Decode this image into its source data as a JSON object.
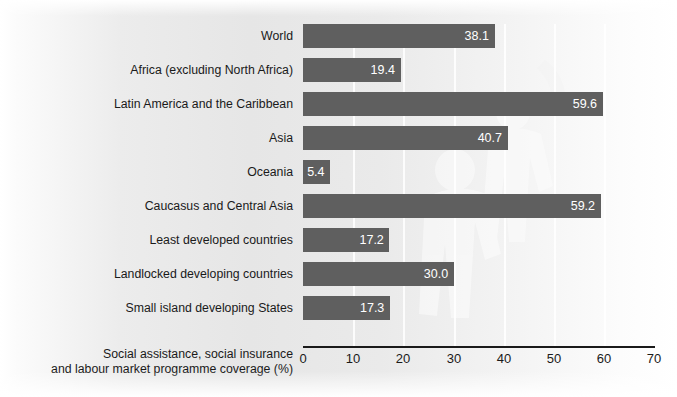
{
  "chart_data": {
    "type": "bar",
    "orientation": "horizontal",
    "title": "",
    "xlabel_lines": [
      "Social assistance, social insurance",
      "and labour market programme coverage (%)"
    ],
    "ylabel": "",
    "xlim": [
      0,
      70
    ],
    "xticks": [
      0,
      10,
      20,
      30,
      40,
      50,
      60,
      70
    ],
    "xtick_labels": [
      "0",
      "10",
      "20",
      "30",
      "40",
      "50",
      "60",
      "70"
    ],
    "grid": true,
    "legend": false,
    "categories": [
      "World",
      "Africa (excluding North Africa)",
      "Latin America and the Caribbean",
      "Asia",
      "Oceania",
      "Caucasus and Central Asia",
      "Least developed countries",
      "Landlocked developing countries",
      "Small island developing States"
    ],
    "values": [
      38.1,
      19.4,
      59.6,
      40.7,
      5.4,
      59.2,
      17.2,
      30.0,
      17.3
    ],
    "value_labels": [
      "38.1",
      "19.4",
      "59.6",
      "40.7",
      "5.4",
      "59.2",
      "17.2",
      "30.0",
      "17.3"
    ],
    "bar_color": "#5f5f5f",
    "value_label_color": "#ffffff",
    "axis_color": "#1a1a1a",
    "gridline_color": "#ffffff",
    "background_color": "#eaeaea"
  }
}
